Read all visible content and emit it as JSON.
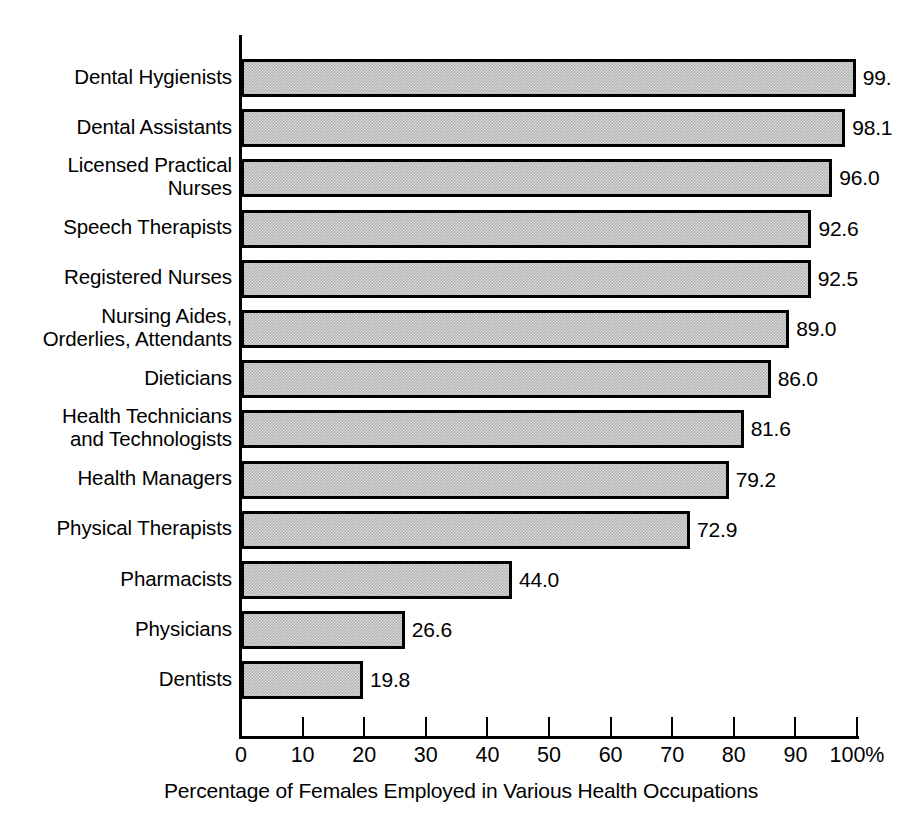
{
  "chart_data": {
    "type": "bar",
    "orientation": "horizontal",
    "title": "",
    "xlabel": "Percentage of Females Employed in Various Health Occupations",
    "ylabel": "",
    "xlim": [
      0,
      100
    ],
    "grid": false,
    "legend": null,
    "categories": [
      "Dental Hygienists",
      "Dental Assistants",
      "Licensed Practical\nNurses",
      "Speech Therapists",
      "Registered Nurses",
      "Nursing Aides,\nOrderlies, Attendants",
      "Dieticians",
      "Health Technicians\nand Technologists",
      "Health Managers",
      "Physical Therapists",
      "Pharmacists",
      "Physicians",
      "Dentists"
    ],
    "values": [
      99.8,
      98.1,
      96.0,
      92.6,
      92.5,
      89.0,
      86.0,
      81.6,
      79.2,
      72.9,
      44.0,
      26.6,
      19.8
    ],
    "data_labels": [
      "99.",
      "98.1",
      "96.0",
      "92.6",
      "92.5",
      "89.0",
      "86.0",
      "81.6",
      "79.2",
      "72.9",
      "44.0",
      "26.6",
      "19.8"
    ],
    "xticks": [
      0,
      10,
      20,
      30,
      40,
      50,
      60,
      70,
      80,
      90,
      100
    ],
    "xtick_labels": [
      "0",
      "10",
      "20",
      "30",
      "40",
      "50",
      "60",
      "70",
      "80",
      "90",
      "100%"
    ],
    "bar_fill_color": "#b4b4b4",
    "bar_border_color": "#000000",
    "background_color": "#ffffff"
  }
}
